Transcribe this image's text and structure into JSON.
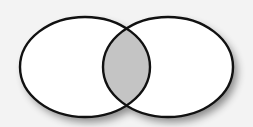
{
  "diagram": {
    "type": "venn",
    "sets": [
      {
        "id": "left",
        "cx": 85,
        "cy": 67,
        "rx": 65,
        "ry": 50,
        "fill": "#ffffff"
      },
      {
        "id": "right",
        "cx": 168,
        "cy": 67,
        "rx": 65,
        "ry": 50,
        "fill": "#ffffff"
      }
    ],
    "intersection": {
      "fill": "#c4c4c4",
      "highlighted": true
    },
    "stroke_color": "#111111",
    "stroke_width": 2.4,
    "background": "#f3f3f3",
    "shadow_color": "#9a9a9a"
  }
}
